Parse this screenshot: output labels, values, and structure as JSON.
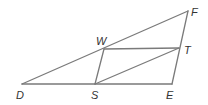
{
  "figure": {
    "type": "geometry",
    "line_color": "#7a7a7a",
    "label_color": "#333333",
    "points": {
      "D": {
        "label": "D",
        "x": 22,
        "y": 84,
        "lx": 16,
        "ly": 99
      },
      "S": {
        "label": "S",
        "x": 95,
        "y": 84,
        "lx": 91,
        "ly": 99
      },
      "E": {
        "label": "E",
        "x": 172,
        "y": 84,
        "lx": 166,
        "ly": 99
      },
      "F": {
        "label": "F",
        "x": 188,
        "y": 11,
        "lx": 191,
        "ly": 16
      },
      "W": {
        "label": "W",
        "x": 104,
        "y": 49,
        "lx": 96,
        "ly": 45
      },
      "T": {
        "label": "T",
        "x": 179,
        "y": 48,
        "lx": 184,
        "ly": 54
      }
    },
    "segments": [
      {
        "name": "segment-DF",
        "from": "D",
        "to": "F"
      },
      {
        "name": "segment-DE",
        "from": "D",
        "to": "E"
      },
      {
        "name": "segment-EF",
        "from": "E",
        "to": "F"
      },
      {
        "name": "segment-WT",
        "from": "W",
        "to": "T"
      },
      {
        "name": "segment-WS",
        "from": "W",
        "to": "S"
      },
      {
        "name": "segment-ST",
        "from": "S",
        "to": "T"
      }
    ]
  }
}
